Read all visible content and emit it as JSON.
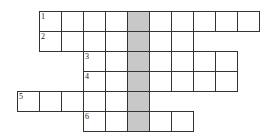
{
  "grid": {
    "cell_w": 22,
    "cell_h": 20,
    "origin_x": 39,
    "origin_y": 11,
    "shaded_col": 4,
    "shaded_color": "#c8c8c8",
    "rows": [
      {
        "number": "1",
        "start_col": 0,
        "length": 10
      },
      {
        "number": "2",
        "start_col": 0,
        "length": 7
      },
      {
        "number": "3",
        "start_col": 2,
        "length": 7
      },
      {
        "number": "4",
        "start_col": 2,
        "length": 7
      },
      {
        "number": "5",
        "start_col": -1,
        "length": 6
      },
      {
        "number": "6",
        "start_col": 2,
        "length": 5
      }
    ]
  }
}
